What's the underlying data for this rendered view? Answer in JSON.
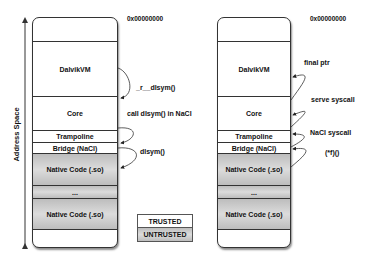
{
  "axis": {
    "label": "Address Space"
  },
  "left": {
    "address": "0x00000000",
    "segments": [
      {
        "label": "",
        "top": 0,
        "height": 23,
        "type": "trusted"
      },
      {
        "label": "DalvikVM",
        "top": 23,
        "height": 55,
        "type": "trusted"
      },
      {
        "label": "Core",
        "top": 78,
        "height": 34,
        "type": "trusted"
      },
      {
        "label": "Trampoline",
        "top": 112,
        "height": 12,
        "type": "trusted"
      },
      {
        "label": "Bridge (NaCl)",
        "top": 124,
        "height": 11,
        "type": "trusted"
      },
      {
        "label": "Native Code (.so)",
        "top": 135,
        "height": 32,
        "type": "untrusted"
      },
      {
        "label": "...",
        "top": 167,
        "height": 13,
        "type": "untrusted"
      },
      {
        "label": "Native Code (.so)",
        "top": 180,
        "height": 31,
        "type": "untrusted"
      },
      {
        "label": "",
        "top": 211,
        "height": 20,
        "type": "trusted"
      }
    ],
    "arrows": [
      {
        "label": "_r__dlsym()"
      },
      {
        "label": "call dlsym() in NaCl"
      },
      {
        "label": "dlsym()"
      }
    ]
  },
  "right": {
    "address": "0x00000000",
    "segments": [
      {
        "label": "",
        "top": 0,
        "height": 23,
        "type": "trusted"
      },
      {
        "label": "DalvikVM",
        "top": 23,
        "height": 55,
        "type": "trusted"
      },
      {
        "label": "Core",
        "top": 78,
        "height": 34,
        "type": "trusted"
      },
      {
        "label": "Trampoline",
        "top": 112,
        "height": 12,
        "type": "trusted"
      },
      {
        "label": "Bridge (NaCl)",
        "top": 124,
        "height": 11,
        "type": "trusted"
      },
      {
        "label": "Native Code (.so)",
        "top": 135,
        "height": 32,
        "type": "untrusted"
      },
      {
        "label": "...",
        "top": 167,
        "height": 13,
        "type": "untrusted"
      },
      {
        "label": "Native Code (.so)",
        "top": 180,
        "height": 31,
        "type": "untrusted"
      },
      {
        "label": "",
        "top": 211,
        "height": 20,
        "type": "trusted"
      }
    ],
    "arrows": [
      {
        "label": "final ptr"
      },
      {
        "label": "serve syscall"
      },
      {
        "label": "NaCl syscall"
      },
      {
        "label": "(*f)()"
      }
    ]
  },
  "legend": {
    "trusted": "TRUSTED",
    "untrusted": "UNTRUSTED"
  },
  "colors": {
    "trusted": "#ffffff",
    "untrusted": "#c8c8c8",
    "line": "#333333"
  }
}
